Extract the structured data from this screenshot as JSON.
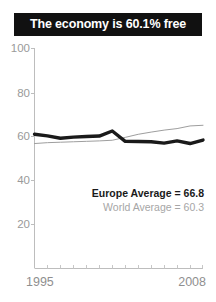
{
  "figure": {
    "title": "The economy is 60.1% free",
    "background_color": "#ffffff",
    "banner_color": "#111111",
    "banner_text_color": "#ffffff"
  },
  "axes": {
    "y_ticks": [
      "100",
      "80",
      "60",
      "40",
      "20"
    ],
    "x_tick_start": "1995",
    "x_tick_end": "2008",
    "tick_color": "#9a9a9a"
  },
  "legend": {
    "europe_label": "Europe Average = 66.8",
    "world_label": "World Average = 60.3",
    "europe_color": "#1a1a1a",
    "world_color": "#a6a6a6"
  },
  "chart_data": {
    "type": "line",
    "title": "The economy is 60.1% free",
    "xlabel": "",
    "ylabel": "",
    "xlim": [
      1995,
      2008
    ],
    "ylim": [
      0,
      100
    ],
    "yticks": [
      20,
      40,
      60,
      80,
      100
    ],
    "xticks": [
      1995,
      1996,
      1997,
      1998,
      1999,
      2000,
      2001,
      2002,
      2003,
      2004,
      2005,
      2006,
      2007,
      2008
    ],
    "xtick_labels_shown": [
      "1995",
      "2008"
    ],
    "grid": false,
    "legend_position": "inside-lower-right",
    "x": [
      1995,
      1996,
      1997,
      1998,
      1999,
      2000,
      2001,
      2002,
      2003,
      2004,
      2005,
      2006,
      2007,
      2008
    ],
    "series": [
      {
        "name": "Europe Average = 66.8",
        "short_name": "Europe Average",
        "average": 66.8,
        "color": "#1a1a1a",
        "line_width": 3.4,
        "values": [
          61.0,
          60.3,
          59.2,
          59.7,
          60.0,
          60.2,
          62.5,
          57.8,
          57.7,
          57.6,
          57.0,
          58.0,
          56.8,
          58.4
        ]
      },
      {
        "name": "World Average = 60.3",
        "short_name": "World Average",
        "average": 60.3,
        "color": "#9e9e9e",
        "line_width": 1.0,
        "values": [
          56.8,
          57.2,
          57.4,
          57.6,
          57.8,
          58.0,
          58.3,
          59.6,
          61.0,
          62.0,
          62.9,
          63.6,
          64.8,
          65.1
        ]
      }
    ]
  }
}
